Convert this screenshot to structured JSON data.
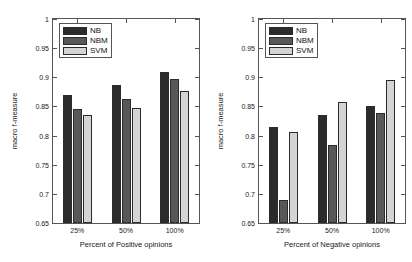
{
  "chart_data": [
    {
      "type": "bar",
      "panel": "left",
      "title": "",
      "xlabel": "Percent of Positive opinions",
      "ylabel": "macro f-measure",
      "categories": [
        "25%",
        "50%",
        "100%"
      ],
      "ylim": [
        0.65,
        1
      ],
      "yticks": [
        0.65,
        0.7,
        0.75,
        0.8,
        0.85,
        0.9,
        0.95,
        1
      ],
      "yticklabels": [
        "0.65",
        "0.7",
        "0.75",
        "0.8",
        "0.85",
        "0.9",
        "0.95",
        "1"
      ],
      "grid": false,
      "legend_position": "upper-left",
      "series": [
        {
          "name": "NB",
          "color": "#2b2b2b",
          "values": [
            0.87,
            0.887,
            0.909
          ]
        },
        {
          "name": "NBM",
          "color": "#585858",
          "values": [
            0.845,
            0.863,
            0.897
          ]
        },
        {
          "name": "SVM",
          "color": "#d4d4d4",
          "values": [
            0.835,
            0.848,
            0.877
          ]
        }
      ]
    },
    {
      "type": "bar",
      "panel": "right",
      "title": "",
      "xlabel": "Percent of Negative opinions",
      "ylabel": "macro f-measure",
      "categories": [
        "25%",
        "50%",
        "100%"
      ],
      "ylim": [
        0.65,
        1
      ],
      "yticks": [
        0.65,
        0.7,
        0.75,
        0.8,
        0.85,
        0.9,
        0.95,
        1
      ],
      "yticklabels": [
        "0.65",
        "0.7",
        "0.75",
        "0.8",
        "0.85",
        "0.9",
        "0.95",
        "1"
      ],
      "grid": false,
      "legend_position": "upper-left",
      "series": [
        {
          "name": "NB",
          "color": "#2b2b2b",
          "values": [
            0.815,
            0.835,
            0.85
          ]
        },
        {
          "name": "NBM",
          "color": "#585858",
          "values": [
            0.69,
            0.783,
            0.839
          ]
        },
        {
          "name": "SVM",
          "color": "#d4d4d4",
          "values": [
            0.807,
            0.858,
            0.896
          ]
        }
      ]
    }
  ]
}
